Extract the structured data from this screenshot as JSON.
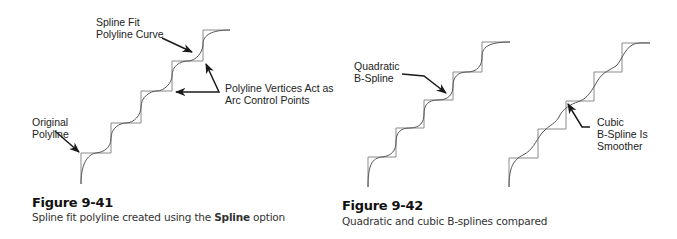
{
  "figures": [
    {
      "id": "figure-9-41",
      "title": "Figure 9-41",
      "caption_before": "Spline fit polyline created using the ",
      "caption_bold": "Spline",
      "caption_after": " option",
      "labels": {
        "spline_fit_line1": "Spline Fit",
        "spline_fit_line2": "Polyline Curve",
        "vertices_line1": "Polyline Vertices Act as",
        "vertices_line2": "Arc Control Points",
        "original_line1": "Original",
        "original_line2": "Polyline"
      }
    },
    {
      "id": "figure-9-42",
      "title": "Figure 9-42",
      "caption": "Quadratic and cubic B-splines compared",
      "labels": {
        "quadratic_line1": "Quadratic",
        "quadratic_line2": "B-Spline",
        "cubic_line1": "Cubic",
        "cubic_line2": "B-Spline Is",
        "cubic_line3": "Smoother"
      }
    }
  ],
  "colors": {
    "polyline": "#8a8a8a",
    "curve": "#555555",
    "arrow": "#1a1a1a"
  }
}
